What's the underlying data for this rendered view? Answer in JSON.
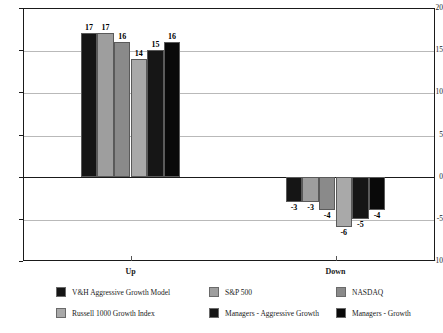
{
  "chart_data": {
    "type": "bar",
    "title": "",
    "subtitle": "",
    "xlabel": "",
    "ylabel": "",
    "categories": [
      "Up",
      "Down"
    ],
    "ylim": [
      -10,
      20
    ],
    "yticks": [
      20,
      15,
      10,
      5,
      0,
      -5,
      -10
    ],
    "ytick_labels": [
      "20",
      "15",
      "10",
      "5",
      "0",
      "-5",
      "-10"
    ],
    "grid": true,
    "grid_axis": "y",
    "legend_position": "bottom",
    "series": [
      {
        "name": "V&H Aggressive Growth Model",
        "color": "#151515",
        "values": [
          17,
          -3
        ],
        "labels": [
          "17",
          "-3"
        ]
      },
      {
        "name": "S&P 500",
        "color": "#9e9e9e",
        "values": [
          17,
          -3
        ],
        "labels": [
          "17",
          "-3"
        ]
      },
      {
        "name": "NASDAQ",
        "color": "#8a8a8a",
        "values": [
          16,
          -4
        ],
        "labels": [
          "16",
          "-4"
        ]
      },
      {
        "name": "Russell 1000 Growth Index",
        "color": "#a9a9a9",
        "values": [
          14,
          -6
        ],
        "labels": [
          "14",
          "-6"
        ]
      },
      {
        "name": "Managers - Aggressive Growth",
        "color": "#161616",
        "values": [
          15,
          -5
        ],
        "labels": [
          "15",
          "-5"
        ]
      },
      {
        "name": "Managers - Growth",
        "color": "#090909",
        "values": [
          16,
          -4
        ],
        "labels": [
          "16",
          "-4"
        ]
      }
    ]
  },
  "axis": {
    "y_labels": [
      "20",
      "15",
      "10",
      "5",
      "0",
      "-5",
      "-10"
    ],
    "x_labels": [
      "Up",
      "Down"
    ]
  },
  "legend": {
    "items": [
      {
        "label": "V&H Aggressive Growth Model",
        "color": "#151515"
      },
      {
        "label": "S&P 500",
        "color": "#9e9e9e"
      },
      {
        "label": "NASDAQ",
        "color": "#8a8a8a"
      },
      {
        "label": "Russell 1000 Growth Index",
        "color": "#a9a9a9"
      },
      {
        "label": "Managers - Aggressive Growth",
        "color": "#161616"
      },
      {
        "label": "Managers - Growth",
        "color": "#090909"
      }
    ]
  }
}
